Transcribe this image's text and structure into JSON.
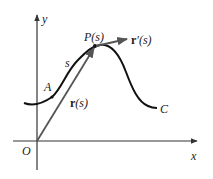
{
  "diagram": {
    "axes": {
      "x_label": "x",
      "y_label": "y",
      "origin_label": "O"
    },
    "curve": {
      "name_label": "C",
      "start_point_label": "A",
      "arc_length_label": "s"
    },
    "point": {
      "label": "P(s)"
    },
    "position_vector": {
      "label_bold": "r",
      "label_rest": "(s)"
    },
    "tangent_vector": {
      "label_bold": "r",
      "label_rest": "′(s)"
    },
    "colors": {
      "curve": "#111111",
      "vectors": "#555555",
      "axes": "#333333"
    }
  }
}
